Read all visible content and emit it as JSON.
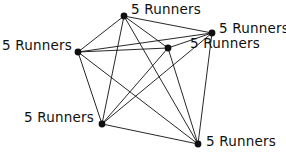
{
  "figure": {
    "background_color": "#ffffff",
    "stroke_color": "#101010",
    "node_color": "#101010",
    "node_radius": 3.4,
    "edge_width": 0.9,
    "label_text": "5 Runners"
  },
  "graph": {
    "type": "complete-graph",
    "node_count": 6,
    "edge_count": 15,
    "nodes": [
      {
        "id": "n0",
        "label": "5 Runners",
        "x": 124,
        "y": 16,
        "label_x": 131,
        "label_y": 2,
        "label_align": "left"
      },
      {
        "id": "n1",
        "label": "5 Runners",
        "x": 212,
        "y": 33,
        "label_x": 219,
        "label_y": 21,
        "label_align": "left"
      },
      {
        "id": "n2",
        "label": "5 Runners",
        "x": 168,
        "y": 48,
        "label_x": 190,
        "label_y": 36,
        "label_align": "left"
      },
      {
        "id": "n3",
        "label": "5 Runners",
        "x": 78,
        "y": 52,
        "label_x": 2,
        "label_y": 38,
        "label_align": "left"
      },
      {
        "id": "n4",
        "label": "5 Runners",
        "x": 102,
        "y": 124,
        "label_x": 24,
        "label_y": 110,
        "label_align": "left"
      },
      {
        "id": "n5",
        "label": "5 Runners",
        "x": 198,
        "y": 144,
        "label_x": 206,
        "label_y": 134,
        "label_align": "left"
      }
    ],
    "edges": [
      {
        "from": "n0",
        "to": "n1"
      },
      {
        "from": "n0",
        "to": "n2"
      },
      {
        "from": "n0",
        "to": "n3"
      },
      {
        "from": "n0",
        "to": "n4"
      },
      {
        "from": "n0",
        "to": "n5"
      },
      {
        "from": "n1",
        "to": "n2"
      },
      {
        "from": "n1",
        "to": "n3"
      },
      {
        "from": "n1",
        "to": "n4"
      },
      {
        "from": "n1",
        "to": "n5"
      },
      {
        "from": "n2",
        "to": "n3"
      },
      {
        "from": "n2",
        "to": "n4"
      },
      {
        "from": "n2",
        "to": "n5"
      },
      {
        "from": "n3",
        "to": "n4"
      },
      {
        "from": "n3",
        "to": "n5"
      },
      {
        "from": "n4",
        "to": "n5"
      }
    ]
  }
}
